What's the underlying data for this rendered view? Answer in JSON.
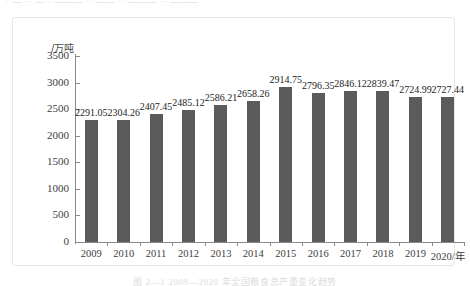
{
  "figure": {
    "top_clipped_text": "· — ·· —·· ——— ·· —— ·· ——— ·· ———",
    "caption_clipped_text": "图 2—1   2009—2020 年全国粮食总产量变化趋势"
  },
  "chart_data": {
    "type": "bar",
    "title": "",
    "xlabel": "2020/年",
    "ylabel": "/万吨",
    "categories": [
      "2009",
      "2010",
      "2011",
      "2012",
      "2013",
      "2014",
      "2015",
      "2016",
      "2017",
      "2018",
      "2019",
      "2020"
    ],
    "x_tick_labels": [
      "2009",
      "2010",
      "2011",
      "2012",
      "2013",
      "2014",
      "2015",
      "2016",
      "2017",
      "2018",
      "2019",
      "2020/年"
    ],
    "values": [
      2291.05,
      2304.26,
      2407.45,
      2485.12,
      2586.21,
      2658.26,
      2914.75,
      2796.35,
      2846.12,
      2839.47,
      2724.99,
      2727.44
    ],
    "value_labels": [
      "2291.05",
      "2304.26",
      "2407.45",
      "2485.12",
      "2586.21",
      "2658.26",
      "2914.75",
      "2796.35",
      "2846.12",
      "2839.47",
      "2724.99",
      "2727.44"
    ],
    "ylim": [
      0,
      3500
    ],
    "y_tick_values": [
      0,
      500,
      1000,
      1500,
      2000,
      2500,
      3000,
      3500
    ],
    "y_tick_labels": [
      "0",
      "500",
      "1000",
      "1500",
      "2000",
      "2500",
      "3000",
      "3500"
    ],
    "grid": false,
    "legend": "none",
    "bar_color": "#5b5b5b",
    "axis_color": "#8a8a8a",
    "frame_color": "#e6e6e6"
  }
}
